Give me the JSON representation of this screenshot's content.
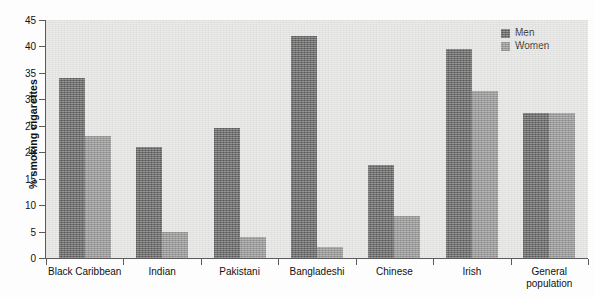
{
  "chart_data": {
    "type": "bar",
    "title": "",
    "subtitle": "",
    "xlabel": "",
    "ylabel": "% smoking cigarettes",
    "ylim": [
      0,
      45
    ],
    "yticks": [
      0,
      5,
      10,
      15,
      20,
      25,
      30,
      35,
      40,
      45
    ],
    "ytick_labels": [
      "0",
      "5",
      "10",
      "15",
      "20",
      "25",
      "30",
      "35",
      "40",
      "45"
    ],
    "grid": false,
    "legend_position": "top-right inside plot area",
    "categories": [
      "Black Caribbean",
      "Indian",
      "Pakistani",
      "Bangladeshi",
      "Chinese",
      "Irish",
      "General\npopulation"
    ],
    "series": [
      {
        "name": "Men",
        "color": "#5a5a5a",
        "values": [
          34,
          21,
          24.5,
          42,
          17.5,
          39.5,
          27.5
        ]
      },
      {
        "name": "Women",
        "color": "#8d8d8d",
        "values": [
          23,
          5,
          4,
          2,
          8,
          31.5,
          27.5
        ]
      }
    ],
    "annotations": []
  },
  "legend": {
    "items": [
      {
        "label": "Men",
        "swatch": "men"
      },
      {
        "label": "Women",
        "swatch": "women"
      }
    ]
  },
  "colors": {
    "men_bar": "#5a5a5a",
    "women_bar": "#8d8d8d",
    "plot_background": "#e2e2e0",
    "page_background": "#fdfdfd",
    "axis": "#5b5b5b",
    "text": "#111111"
  }
}
